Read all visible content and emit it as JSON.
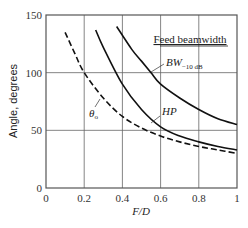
{
  "chart_data": {
    "type": "line",
    "title": "",
    "xlabel": "F/D",
    "ylabel": "Angle, degrees",
    "xlim": [
      0,
      1
    ],
    "ylim": [
      0,
      150
    ],
    "x_ticks": [
      "0",
      "0.2",
      "0.4",
      "0.6",
      "0.8",
      "1"
    ],
    "y_ticks": [
      "0",
      "50",
      "100",
      "150"
    ],
    "grid": true,
    "legend_title": "Feed beamwidth",
    "series": [
      {
        "name": "BW-10 dB",
        "style": "solid",
        "x": [
          0.37,
          0.45,
          0.5,
          0.55,
          0.6,
          0.7,
          0.8,
          0.9,
          1.0
        ],
        "y": [
          140,
          120,
          110,
          100,
          90,
          78,
          68,
          60,
          55
        ]
      },
      {
        "name": "HP",
        "style": "solid",
        "x": [
          0.26,
          0.3,
          0.4,
          0.5,
          0.6,
          0.7,
          0.8,
          0.9,
          1.0
        ],
        "y": [
          137,
          122,
          90,
          68,
          53,
          45,
          40,
          36,
          33
        ]
      },
      {
        "name": "θo",
        "style": "dashed",
        "x": [
          0.1,
          0.15,
          0.2,
          0.3,
          0.4,
          0.5,
          0.6,
          0.7,
          0.8,
          0.9,
          1.0
        ],
        "y": [
          135,
          117,
          100,
          78,
          62,
          52,
          45,
          40,
          36,
          33,
          30
        ]
      }
    ],
    "annotations": [
      "BW-10 dB",
      "HP",
      "θo",
      "Feed beamwidth"
    ]
  },
  "labels": {
    "legend_title": "Feed beamwidth",
    "bw_main": "BW",
    "bw_sub": "−10 dB",
    "hp": "HP",
    "theta_main": "θ",
    "theta_sub": "o",
    "xlabel": "F/D",
    "ylabel": "Angle, degrees"
  }
}
